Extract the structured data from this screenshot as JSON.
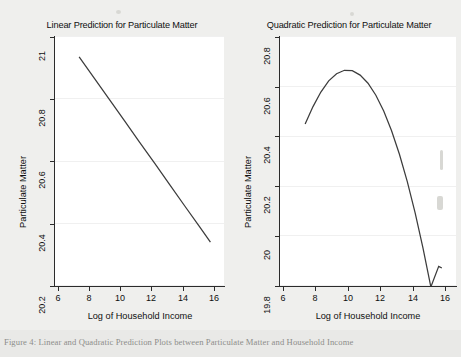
{
  "caption": "Figure 4: Linear and Quadratic Prediction Plots between Particulate Matter and Household Income",
  "chart_data": [
    {
      "type": "line",
      "title": "Linear Prediction for Particulate Matter",
      "xlabel": "Log of Household Income",
      "ylabel": "Particulate Matter",
      "xlim": [
        5.4,
        16.6
      ],
      "ylim": [
        20.15,
        21.05
      ],
      "xticks": [
        "6",
        "8",
        "10",
        "12",
        "14",
        "16"
      ],
      "xtick_values": [
        6,
        8,
        10,
        12,
        14,
        16
      ],
      "yticks": [
        "20.2",
        "20.4",
        "20.6",
        "20.8",
        "21"
      ],
      "ytick_values": [
        20.2,
        20.4,
        20.6,
        20.8,
        21
      ],
      "grid": true,
      "legend": "none",
      "series": [
        {
          "name": "Linear prediction",
          "x": [
            7.0,
            8.0,
            9.0,
            10.0,
            11.0,
            12.0,
            13.0,
            14.0,
            15.0,
            15.7
          ],
          "y": [
            20.975,
            20.898,
            20.822,
            20.745,
            20.668,
            20.592,
            20.515,
            20.438,
            20.362,
            20.308
          ]
        }
      ]
    },
    {
      "type": "line",
      "title": "Quadratic Prediction for Particulate Matter",
      "xlabel": "Log of Household Income",
      "ylabel": "Particulate Matter",
      "xlim": [
        5.4,
        16.6
      ],
      "ylim": [
        19.77,
        20.85
      ],
      "xticks": [
        "6",
        "8",
        "10",
        "12",
        "14",
        "16"
      ],
      "xtick_values": [
        6,
        8,
        10,
        12,
        14,
        16
      ],
      "yticks": [
        "19.8",
        "20",
        "20.2",
        "20.4",
        "20.6",
        "20.8"
      ],
      "ytick_values": [
        19.8,
        20.0,
        20.2,
        20.4,
        20.6,
        20.8
      ],
      "grid": true,
      "legend": "none",
      "series": [
        {
          "name": "Quadratic prediction",
          "x": [
            7.0,
            7.5,
            8.0,
            8.5,
            9.0,
            9.5,
            10.0,
            10.5,
            11.0,
            11.5,
            12.0,
            12.5,
            13.0,
            13.5,
            14.0,
            14.5,
            15.0,
            15.5,
            15.7
          ],
          "y": [
            20.47,
            20.545,
            20.608,
            20.656,
            20.687,
            20.702,
            20.7,
            20.681,
            20.646,
            20.594,
            20.526,
            20.441,
            20.339,
            20.221,
            20.086,
            19.934,
            19.766,
            19.855,
            19.848
          ]
        }
      ]
    }
  ],
  "colors": {
    "line": "#3c3c3c",
    "axis": "#2b2b2b",
    "grid": "#f0f0f0",
    "plot_background": "#ffffff",
    "page_background": "#efefed"
  }
}
